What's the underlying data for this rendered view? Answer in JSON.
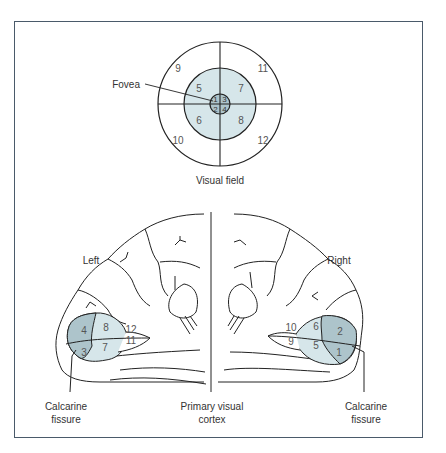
{
  "figure": {
    "visual_field": {
      "caption": "Visual field",
      "fovea_label": "Fovea",
      "outer_ring_numbers": [
        "9",
        "11",
        "10",
        "12"
      ],
      "middle_ring_numbers": [
        "5",
        "7",
        "6",
        "8"
      ],
      "foveal_numbers": [
        "1",
        "3",
        "2",
        "4"
      ]
    },
    "brain": {
      "left_label": "Left",
      "right_label": "Right",
      "left_regions": [
        "4",
        "3",
        "8",
        "7",
        "12",
        "11"
      ],
      "right_regions": [
        "2",
        "1",
        "6",
        "5",
        "10",
        "9"
      ],
      "labels": {
        "calcarine_left": [
          "Calcarine",
          "fissure"
        ],
        "primary_visual_cortex": [
          "Primary visual",
          "cortex"
        ],
        "calcarine_right": [
          "Calcarine",
          "fissure"
        ]
      }
    },
    "colors": {
      "light_shade": "#d6e6ea",
      "dark_shade": "#adc4cb",
      "line": "#222222",
      "frame": "#4a5a6a"
    }
  }
}
